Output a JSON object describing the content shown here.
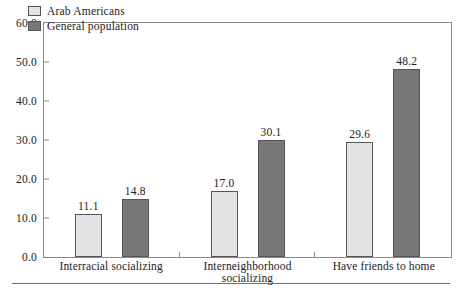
{
  "chart_data": {
    "type": "bar",
    "title": "",
    "xlabel": "",
    "ylabel": "",
    "ylim": [
      0,
      60
    ],
    "ytick_step": 10,
    "ytick_labels": [
      "0.0",
      "10.0",
      "20.0",
      "30.0",
      "40.0",
      "50.0",
      "60.0"
    ],
    "ytick_values": [
      0,
      10,
      20,
      30,
      40,
      50,
      60
    ],
    "grid": false,
    "legend_position": "top-left-inside",
    "categories": [
      "Interracial socializing",
      "Interneighborhood socializing",
      "Have friends to home"
    ],
    "series": [
      {
        "name": "Arab Americans",
        "color": "#e3e3e3",
        "values": [
          11.1,
          17.0,
          29.6
        ],
        "labels": [
          "11.1",
          "17.0",
          "29.6"
        ]
      },
      {
        "name": "General population",
        "color": "#777777",
        "values": [
          14.8,
          30.1,
          48.2
        ],
        "labels": [
          "14.8",
          "30.1",
          "48.2"
        ]
      }
    ]
  },
  "legend": {
    "items": [
      {
        "label": "Arab Americans",
        "color": "#e3e3e3"
      },
      {
        "label": "General population",
        "color": "#777777"
      }
    ]
  },
  "axis": {
    "bar_edge_color": "#555555",
    "frame_color": "#8a8a8a",
    "rule_color": "#6f6f6f"
  }
}
